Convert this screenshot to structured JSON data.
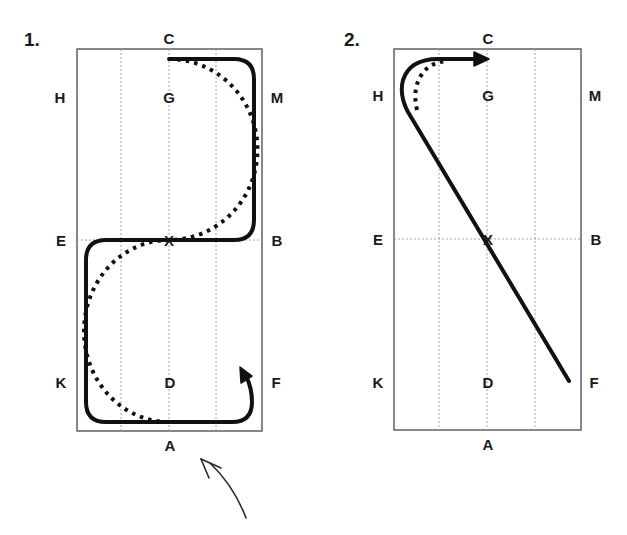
{
  "diagrams": [
    {
      "number": "1.",
      "letters": {
        "top": "C",
        "upper_left": "H",
        "upper_center": "G",
        "upper_right": "M",
        "mid_left": "E",
        "center": "X",
        "mid_right": "B",
        "lower_left": "K",
        "lower_center": "D",
        "lower_right": "F",
        "bottom": "A"
      },
      "figure": "serpentine two loops: solid path with square corners, dotted path as half-circles"
    },
    {
      "number": "2.",
      "letters": {
        "top": "C",
        "upper_left": "H",
        "upper_center": "G",
        "upper_right": "M",
        "mid_left": "E",
        "center": "X",
        "mid_right": "B",
        "lower_left": "K",
        "lower_center": "D",
        "lower_right": "F",
        "bottom": "A"
      },
      "figure": "diagonal F-X-H then turn to C with arrow; dotted tighter turn"
    }
  ],
  "colors": {
    "line": "#111111",
    "arena_border": "#555555",
    "grid": "#9a9a9a",
    "background": "#ffffff"
  },
  "annotation": "hand-drawn arrow pointing up-left below diagram 1"
}
